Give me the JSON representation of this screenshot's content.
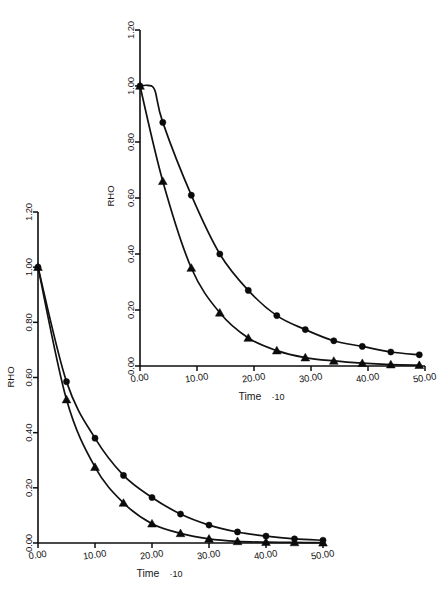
{
  "figure": {
    "background_color": "#ffffff",
    "ink_color": "#111111"
  },
  "charts": [
    {
      "id": "inset",
      "name": "upper-right-chart",
      "ylabel": "RHO",
      "xlabel": "Time",
      "xlabel_suffix": "·10",
      "y_ticks": [
        "0.00",
        "0.20",
        "0.40",
        "0.60",
        "0.80",
        "1.00",
        "1.20"
      ],
      "x_ticks": [
        "0.00",
        "10.00",
        "20.00",
        "30.00",
        "40.00",
        "50.00"
      ]
    },
    {
      "id": "main",
      "name": "lower-left-chart",
      "ylabel": "RHO",
      "xlabel": "Time",
      "xlabel_suffix": "·10",
      "y_ticks": [
        "0.00",
        "0.20",
        "0.40",
        "0.60",
        "0.80",
        "1.00",
        "1.20"
      ],
      "x_ticks": [
        "0.00",
        "10.00",
        "20.00",
        "30.00",
        "40.00",
        "50.00"
      ]
    }
  ],
  "chart_data": [
    {
      "id": "inset",
      "type": "line",
      "title": "",
      "xlabel": "Time ·10",
      "ylabel": "RHO",
      "xlim": [
        0,
        50
      ],
      "ylim": [
        0.0,
        1.2
      ],
      "grid": false,
      "legend": "none",
      "series": [
        {
          "name": "circles",
          "marker": "circle",
          "x": [
            0,
            4,
            9,
            14,
            19,
            24,
            29,
            34,
            39,
            44,
            49
          ],
          "y": [
            1.0,
            0.87,
            0.61,
            0.4,
            0.27,
            0.18,
            0.13,
            0.09,
            0.07,
            0.05,
            0.04
          ]
        },
        {
          "name": "triangles",
          "marker": "triangle",
          "x": [
            0,
            4,
            9,
            14,
            19,
            24,
            29,
            34,
            39,
            44,
            49
          ],
          "y": [
            1.0,
            0.66,
            0.35,
            0.19,
            0.1,
            0.055,
            0.03,
            0.018,
            0.01,
            0.005,
            0.003
          ]
        }
      ]
    },
    {
      "id": "main",
      "type": "line",
      "title": "",
      "xlabel": "Time ·10",
      "ylabel": "RHO",
      "xlim": [
        0,
        50
      ],
      "ylim": [
        0.0,
        1.2
      ],
      "grid": false,
      "legend": "none",
      "series": [
        {
          "name": "circles",
          "marker": "circle",
          "x": [
            0,
            5,
            10,
            15,
            20,
            25,
            30,
            35,
            40,
            45,
            50
          ],
          "y": [
            1.0,
            0.585,
            0.38,
            0.245,
            0.165,
            0.105,
            0.065,
            0.04,
            0.025,
            0.015,
            0.01
          ]
        },
        {
          "name": "triangles",
          "marker": "triangle",
          "x": [
            0,
            5,
            10,
            15,
            20,
            25,
            30,
            35,
            40,
            45,
            50
          ],
          "y": [
            1.0,
            0.52,
            0.275,
            0.145,
            0.07,
            0.035,
            0.015,
            0.006,
            0.003,
            0.002,
            0.001
          ]
        }
      ]
    }
  ]
}
